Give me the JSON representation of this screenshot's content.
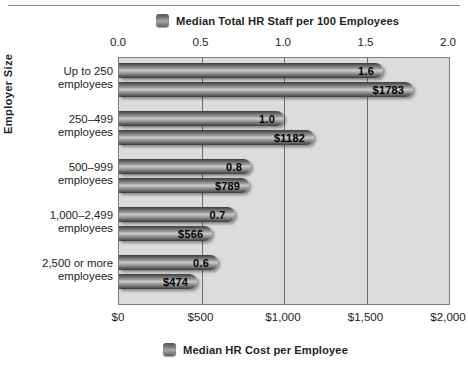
{
  "chart_data": {
    "type": "bar",
    "orientation": "horizontal",
    "title": "",
    "categories": [
      "Up to 250\nemployees",
      "250–499\nemployees",
      "500–999\nemployees",
      "1,000–2,499\nemployees",
      "2,500 or more\nemployees"
    ],
    "series": [
      {
        "name": "Median Total HR Staff per 100 Employees",
        "axis": "top",
        "values": [
          1.6,
          1.0,
          0.8,
          0.7,
          0.6
        ],
        "labels": [
          "1.6",
          "1.0",
          "0.8",
          "0.7",
          "0.6"
        ],
        "color": "#8f8f8f"
      },
      {
        "name": "Median HR Cost per Employee",
        "axis": "bottom",
        "values": [
          1783,
          1182,
          789,
          566,
          474
        ],
        "labels": [
          "$1783",
          "$1182",
          "$789",
          "$566",
          "$474"
        ],
        "color": "#8f8f8f"
      }
    ],
    "ylabel": "Employer Size",
    "xlabel_top": "Median Total HR Staff per 100 Employees",
    "xlabel_bottom": "Median HR Cost per Employee",
    "top_axis": {
      "ticks": [
        "0.0",
        "0.5",
        "1.0",
        "1.5",
        "2.0"
      ],
      "values": [
        0.0,
        0.5,
        1.0,
        1.5,
        2.0
      ],
      "xlim": [
        0.0,
        2.0
      ]
    },
    "bottom_axis": {
      "ticks": [
        "$0",
        "$500",
        "$1,000",
        "$1,500",
        "$2,000"
      ],
      "values": [
        0,
        500,
        1000,
        1500,
        2000
      ],
      "xlim": [
        0,
        2000
      ]
    },
    "grid": true,
    "legend_position": "top and bottom, centered",
    "plot_background": "#dcdcdc"
  },
  "legend_top": {
    "label": "Median Total HR Staff per 100 Employees",
    "swatch": "legend-swatch-icon"
  },
  "legend_bottom": {
    "label": "Median HR Cost per Employee",
    "swatch": "legend-swatch-icon"
  },
  "axis_title": {
    "y": "Employer Size"
  },
  "top_ticks": [
    {
      "label": "0.0",
      "pos": 0.0
    },
    {
      "label": "0.5",
      "pos": 0.25
    },
    {
      "label": "1.0",
      "pos": 0.5
    },
    {
      "label": "1.5",
      "pos": 0.75
    },
    {
      "label": "2.0",
      "pos": 1.0
    }
  ],
  "bottom_ticks": [
    {
      "label": "$0",
      "pos": 0.0
    },
    {
      "label": "$500",
      "pos": 0.25
    },
    {
      "label": "$1,000",
      "pos": 0.5
    },
    {
      "label": "$1,500",
      "pos": 0.75
    },
    {
      "label": "$2,000",
      "pos": 1.0
    }
  ],
  "groups": [
    {
      "cat_line1": "Up to 250",
      "cat_line2": "employees",
      "staff_label": "1.6",
      "staff_value": 1.6,
      "cost_label": "$1783",
      "cost_value": 1783
    },
    {
      "cat_line1": "250–499",
      "cat_line2": "employees",
      "staff_label": "1.0",
      "staff_value": 1.0,
      "cost_label": "$1182",
      "cost_value": 1182
    },
    {
      "cat_line1": "500–999",
      "cat_line2": "employees",
      "staff_label": "0.8",
      "staff_value": 0.8,
      "cost_label": "$789",
      "cost_value": 789
    },
    {
      "cat_line1": "1,000–2,499",
      "cat_line2": "employees",
      "staff_label": "0.7",
      "staff_value": 0.7,
      "cost_label": "$566",
      "cost_value": 566
    },
    {
      "cat_line1": "2,500 or more",
      "cat_line2": "employees",
      "staff_label": "0.6",
      "staff_value": 0.6,
      "cost_label": "$474",
      "cost_value": 474
    }
  ]
}
